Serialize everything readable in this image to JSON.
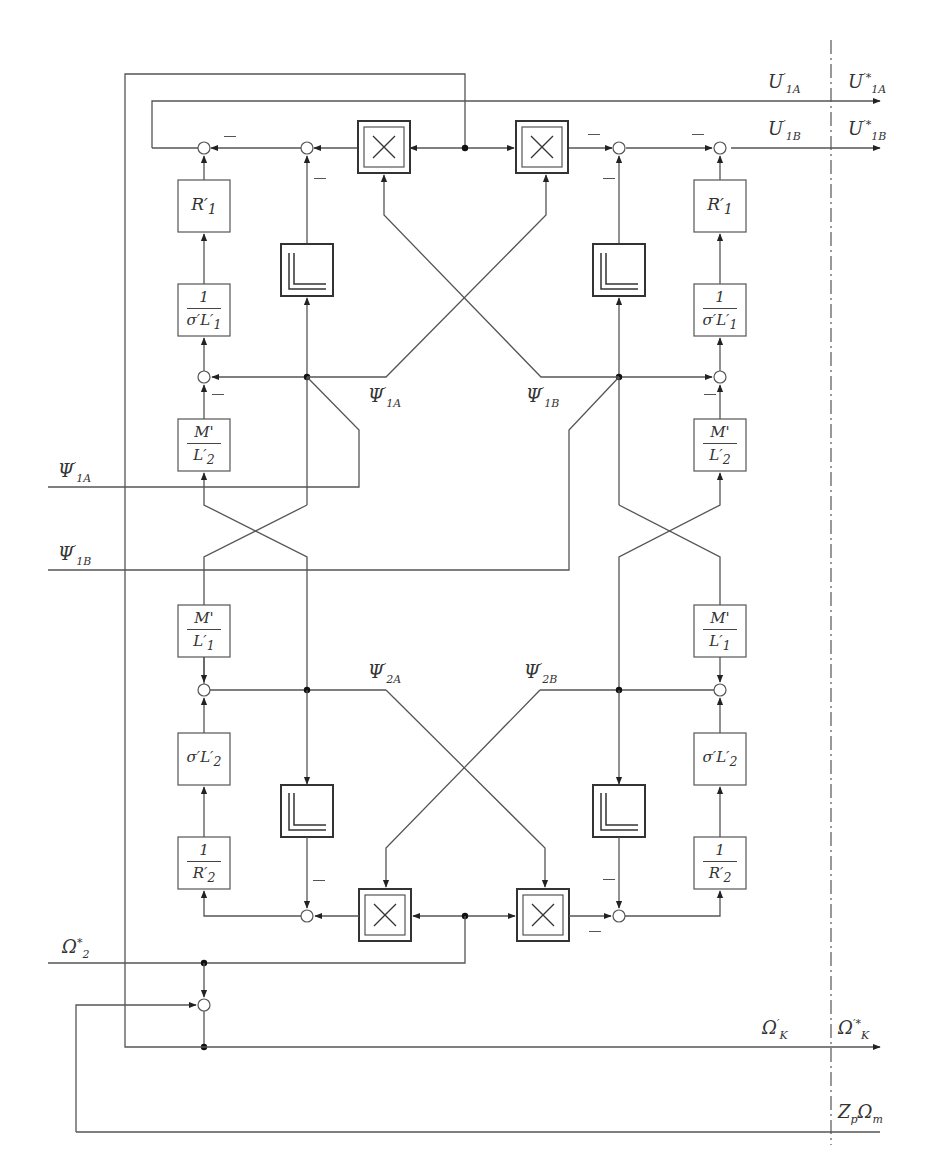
{
  "diagram": {
    "type": "block-diagram",
    "outputs": {
      "u1a": "U'1A",
      "u1a_star": "U'*1A",
      "u1b": "U'1B",
      "u1b_star": "U'*1B",
      "omega_k": "Ω'K",
      "omega_k_star": "Ω'*K",
      "zp_omega_m": "ZpΩm"
    },
    "inputs": {
      "psi1a": "Ψ'1A",
      "psi1b": "Ψ'1B",
      "omega2_star": "Ω*2"
    },
    "internal_signals": {
      "psi1a": "Ψ'1A",
      "psi1b": "Ψ'1B",
      "psi2a": "Ψ'2A",
      "psi2b": "Ψ'2B"
    },
    "blocks": {
      "r1_left": "R'1",
      "r1_right": "R'1",
      "inv_sigma_l1_left": {
        "num": "1",
        "den": "σ'L'1"
      },
      "inv_sigma_l1_right": {
        "num": "1",
        "den": "σ'L'1"
      },
      "m_over_l2_left": {
        "num": "M'",
        "den": "L'2"
      },
      "m_over_l2_right": {
        "num": "M'",
        "den": "L'2"
      },
      "m_over_l1_left": {
        "num": "M'",
        "den": "L'1"
      },
      "m_over_l1_right": {
        "num": "M'",
        "den": "L'1"
      },
      "sigma_l2_left": "σ'L'2",
      "sigma_l2_right": "σ'L'2",
      "inv_r2_left": {
        "num": "1",
        "den": "R'2"
      },
      "inv_r2_right": {
        "num": "1",
        "den": "R'2"
      },
      "multiplier_symbol": "×",
      "integrator_count": 4,
      "multiplier_count": 4
    },
    "sign_marker": "−"
  }
}
